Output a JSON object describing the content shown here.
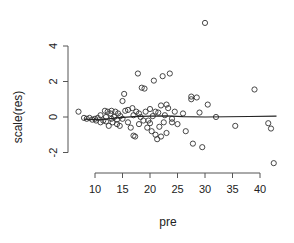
{
  "chart_data": {
    "type": "scatter",
    "title": "",
    "xlabel": "pre",
    "ylabel": "scale(res)",
    "xlim": [
      6.5,
      43.5
    ],
    "ylim": [
      -2.9,
      5.5
    ],
    "xticks": [
      10,
      15,
      20,
      25,
      30,
      35,
      40
    ],
    "yticks": [
      -2,
      0,
      2,
      4
    ],
    "grid": false,
    "legend": null,
    "marker": "open-circle",
    "series": [
      {
        "name": "residuals",
        "points": [
          [
            7,
            0.3
          ],
          [
            8,
            -0.05
          ],
          [
            8.5,
            -0.1
          ],
          [
            9,
            -0.05
          ],
          [
            9.5,
            -0.15
          ],
          [
            10,
            -0.1
          ],
          [
            10.2,
            -0.2
          ],
          [
            10.5,
            -0.05
          ],
          [
            11,
            -0.3
          ],
          [
            11,
            0.1
          ],
          [
            11.5,
            -0.2
          ],
          [
            11.8,
            0.35
          ],
          [
            12,
            0.0
          ],
          [
            12,
            -0.25
          ],
          [
            12.3,
            0.3
          ],
          [
            12.5,
            -0.5
          ],
          [
            12.8,
            0.2
          ],
          [
            13,
            -0.1
          ],
          [
            13,
            0.35
          ],
          [
            13.2,
            -0.3
          ],
          [
            13.5,
            0.0
          ],
          [
            13.7,
            0.3
          ],
          [
            14,
            -0.4
          ],
          [
            14,
            -0.15
          ],
          [
            14.2,
            0.2
          ],
          [
            14.5,
            -0.5
          ],
          [
            14.6,
            0.05
          ],
          [
            15,
            0.9
          ],
          [
            15,
            -0.1
          ],
          [
            15.3,
            1.3
          ],
          [
            15.5,
            0.35
          ],
          [
            16,
            0.4
          ],
          [
            16,
            -0.3
          ],
          [
            16.5,
            -0.6
          ],
          [
            16.8,
            0.5
          ],
          [
            17,
            0.1
          ],
          [
            17,
            -1.05
          ],
          [
            17.3,
            -1.1
          ],
          [
            17.5,
            0.3
          ],
          [
            17.8,
            2.45
          ],
          [
            18,
            0.2
          ],
          [
            18,
            -0.4
          ],
          [
            18.3,
            0.0
          ],
          [
            18.5,
            1.65
          ],
          [
            18.8,
            -0.2
          ],
          [
            19,
            1.6
          ],
          [
            19.2,
            0.3
          ],
          [
            19.5,
            -0.6
          ],
          [
            19.7,
            -0.2
          ],
          [
            20,
            0.45
          ],
          [
            20,
            -0.35
          ],
          [
            20.3,
            -0.8
          ],
          [
            20.5,
            0.05
          ],
          [
            20.7,
            2.05
          ],
          [
            21,
            -1.0
          ],
          [
            21,
            0.3
          ],
          [
            21.3,
            -1.25
          ],
          [
            21.5,
            0.25
          ],
          [
            21.7,
            -0.55
          ],
          [
            22,
            -1.1
          ],
          [
            22,
            0.65
          ],
          [
            22.3,
            2.3
          ],
          [
            22.5,
            -0.3
          ],
          [
            22.7,
            0.1
          ],
          [
            23,
            -0.9
          ],
          [
            23,
            0.7
          ],
          [
            23.3,
            0.5
          ],
          [
            23.6,
            2.45
          ],
          [
            24,
            -0.1
          ],
          [
            24,
            -0.3
          ],
          [
            24.5,
            0.3
          ],
          [
            25,
            -0.4
          ],
          [
            26,
            0.2
          ],
          [
            26.5,
            -0.8
          ],
          [
            27.5,
            1.15
          ],
          [
            27.5,
            1.0
          ],
          [
            27.8,
            -1.5
          ],
          [
            28.5,
            1.1
          ],
          [
            29,
            0.25
          ],
          [
            29.5,
            -1.7
          ],
          [
            30,
            5.3
          ],
          [
            30.5,
            0.7
          ],
          [
            32,
            0.0
          ],
          [
            35.5,
            -0.5
          ],
          [
            39,
            1.55
          ],
          [
            41.5,
            -0.35
          ],
          [
            42,
            -0.65
          ],
          [
            42.5,
            -2.6
          ]
        ]
      }
    ],
    "smooth_line": {
      "name": "lowess",
      "points": [
        [
          8,
          -0.12
        ],
        [
          11,
          -0.15
        ],
        [
          14,
          -0.05
        ],
        [
          17,
          0.02
        ],
        [
          20,
          0.05
        ],
        [
          23,
          0.06
        ],
        [
          26,
          0.02
        ],
        [
          30,
          0.0
        ],
        [
          34,
          0.01
        ],
        [
          38,
          0.03
        ],
        [
          43,
          0.05
        ]
      ]
    }
  },
  "axes": {
    "x_title": "pre",
    "y_title": "scale(res)",
    "x_tick_labels": [
      "10",
      "15",
      "20",
      "25",
      "30",
      "35",
      "40"
    ],
    "y_tick_labels": [
      "-2",
      "0",
      "2",
      "4"
    ]
  },
  "style": {
    "axis_color": "#555555",
    "point_color": "#333333",
    "line_color": "#222222"
  }
}
